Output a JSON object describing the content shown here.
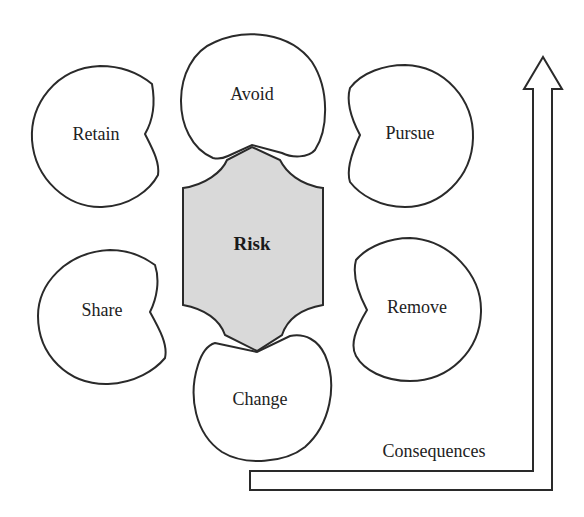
{
  "diagram": {
    "center": {
      "label": "Risk",
      "fill": "#d9d9d9"
    },
    "options": [
      {
        "id": "avoid",
        "label": "Avoid"
      },
      {
        "id": "retain",
        "label": "Retain"
      },
      {
        "id": "pursue",
        "label": "Pursue"
      },
      {
        "id": "share",
        "label": "Share"
      },
      {
        "id": "remove",
        "label": "Remove"
      },
      {
        "id": "change",
        "label": "Change"
      }
    ],
    "arrow": {
      "label": "Consequences"
    }
  }
}
